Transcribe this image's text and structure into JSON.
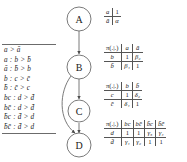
{
  "figure": {
    "caption": "",
    "ranking_list": {
      "name": "conditional-preference-rules",
      "rules": [
        "a > ā",
        "a : b > b̄",
        "ā : b̄ > b",
        "b : c > c̄",
        "b̄ : c̄ > c",
        "bc : d > d̄",
        "bc̄ : d > d̄",
        "b̄c : d̄ > d",
        "b̄c̄ : d̄ > d"
      ]
    },
    "graph": {
      "name": "causal-network",
      "nodes": [
        {
          "id": "A",
          "label": "A"
        },
        {
          "id": "B",
          "label": "B"
        },
        {
          "id": "C",
          "label": "C"
        },
        {
          "id": "D",
          "label": "D"
        }
      ],
      "edges": [
        {
          "from": "A",
          "to": "B",
          "style": "straight"
        },
        {
          "from": "B",
          "to": "C",
          "style": "straight"
        },
        {
          "from": "C",
          "to": "D",
          "style": "straight"
        },
        {
          "from": "B",
          "to": "D",
          "style": "curved"
        }
      ]
    },
    "tables": [
      {
        "name": "table-a",
        "header": [
          "",
          "1"
        ],
        "rows": [
          {
            "label": "a",
            "cells": [
              "1"
            ]
          },
          {
            "label": "ā",
            "cells": [
              "α"
            ]
          }
        ]
      },
      {
        "name": "table-b",
        "pi_label": "π(.|.)",
        "columns": [
          "a",
          "ā"
        ],
        "rows": [
          {
            "label": "b",
            "cells": [
              "1",
              "β₂"
            ]
          },
          {
            "label": "b̄",
            "cells": [
              "β₁",
              "1"
            ]
          }
        ]
      },
      {
        "name": "table-c",
        "pi_label": "π(.|.)",
        "columns": [
          "b",
          "b̄"
        ],
        "rows": [
          {
            "label": "c",
            "cells": [
              "1",
              "δ₂"
            ]
          },
          {
            "label": "c̄",
            "cells": [
              "δ₁",
              "1"
            ]
          }
        ]
      },
      {
        "name": "table-d",
        "pi_label": "π(.|.)",
        "columns": [
          "bc",
          "bc̄",
          "b̄c",
          "b̄c̄"
        ],
        "rows": [
          {
            "label": "d",
            "cells": [
              "1",
              "1",
              "γ₃",
              "γ₄"
            ]
          },
          {
            "label": "d̄",
            "cells": [
              "γ₁",
              "γ₂",
              "1",
              "1"
            ]
          }
        ]
      }
    ],
    "colors": {
      "ink": "#1a1a1a",
      "rule": "#555555",
      "node_stroke": "#666666",
      "background": "#ffffff"
    }
  }
}
